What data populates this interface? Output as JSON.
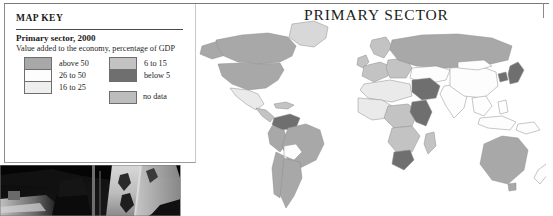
{
  "page": {
    "title": "PRIMARY SECTOR",
    "width": 553,
    "height": 216,
    "background": "#ffffff"
  },
  "map_key": {
    "heading": "MAP KEY",
    "subtitle": "Primary sector, 2000",
    "description": "Value added to the economy, percentage of GDP",
    "legend_left": [
      {
        "label": "above 50",
        "color": "#a8a8a8"
      },
      {
        "label": "26 to 50",
        "color": "#fdfdfd"
      },
      {
        "label": "16 to 25",
        "color": "#eeeeee"
      }
    ],
    "legend_right": [
      {
        "label": "6 to 15",
        "color": "#c3c3c3"
      },
      {
        "label": "below 5",
        "color": "#6f6f6f"
      }
    ],
    "legend_other": [
      {
        "label": "no data",
        "color": "#bdbdbd"
      }
    ]
  },
  "map": {
    "name": "world-choropleth-primary-sector-2000",
    "projection": "equirectangular-world",
    "ocean_color": "#ffffff",
    "border_color": "#8f8f8f",
    "regions": [
      {
        "name": "canada",
        "class": "above50"
      },
      {
        "name": "united-states",
        "class": "above50"
      },
      {
        "name": "greenland",
        "class": "nodata"
      },
      {
        "name": "mexico",
        "class": "v16to25"
      },
      {
        "name": "central-america",
        "class": "v6to15"
      },
      {
        "name": "caribbean",
        "class": "v6to15"
      },
      {
        "name": "brazil",
        "class": "above50"
      },
      {
        "name": "argentina",
        "class": "above50"
      },
      {
        "name": "colombia",
        "class": "below5"
      },
      {
        "name": "venezuela",
        "class": "below5"
      },
      {
        "name": "peru",
        "class": "above50"
      },
      {
        "name": "chile",
        "class": "above50"
      },
      {
        "name": "bolivia",
        "class": "v26to50"
      },
      {
        "name": "western-europe",
        "class": "v6to15"
      },
      {
        "name": "scandinavia",
        "class": "v6to15"
      },
      {
        "name": "united-kingdom",
        "class": "v6to15"
      },
      {
        "name": "eastern-europe",
        "class": "v6to15"
      },
      {
        "name": "russia",
        "class": "above50"
      },
      {
        "name": "north-africa",
        "class": "v16to25"
      },
      {
        "name": "west-africa",
        "class": "v16to25"
      },
      {
        "name": "central-africa",
        "class": "v6to15"
      },
      {
        "name": "east-africa",
        "class": "below5"
      },
      {
        "name": "southern-africa",
        "class": "v6to15"
      },
      {
        "name": "south-africa",
        "class": "below5"
      },
      {
        "name": "middle-east",
        "class": "below5"
      },
      {
        "name": "saudi-arabia",
        "class": "below5"
      },
      {
        "name": "india",
        "class": "v26to50"
      },
      {
        "name": "china",
        "class": "v26to50"
      },
      {
        "name": "southeast-asia",
        "class": "v26to50"
      },
      {
        "name": "japan",
        "class": "below5"
      },
      {
        "name": "korea",
        "class": "below5"
      },
      {
        "name": "indonesia",
        "class": "v26to50"
      },
      {
        "name": "australia",
        "class": "above50"
      },
      {
        "name": "new-zealand",
        "class": "v26to50"
      }
    ]
  },
  "photo": {
    "caption": "",
    "description": "dark photograph of industrial machinery"
  }
}
